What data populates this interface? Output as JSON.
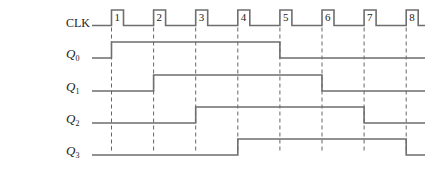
{
  "diagram": {
    "type": "timing-diagram",
    "clock": {
      "label": "CLK",
      "pulse_numbers": [
        "1",
        "2",
        "3",
        "4",
        "5",
        "6",
        "7",
        "8"
      ]
    },
    "signals": [
      {
        "name": "Q",
        "subscript": "0",
        "transitions": [
          [
            0,
            1
          ],
          [
            4,
            0
          ]
        ]
      },
      {
        "name": "Q",
        "subscript": "1",
        "transitions": [
          [
            1,
            1
          ],
          [
            5,
            0
          ]
        ]
      },
      {
        "name": "Q",
        "subscript": "2",
        "transitions": [
          [
            2,
            1
          ],
          [
            6,
            0
          ]
        ]
      },
      {
        "name": "Q",
        "subscript": "3",
        "transitions": [
          [
            3,
            1
          ],
          [
            7,
            0
          ]
        ]
      }
    ],
    "initial_levels": [
      0,
      0,
      0,
      0
    ]
  }
}
